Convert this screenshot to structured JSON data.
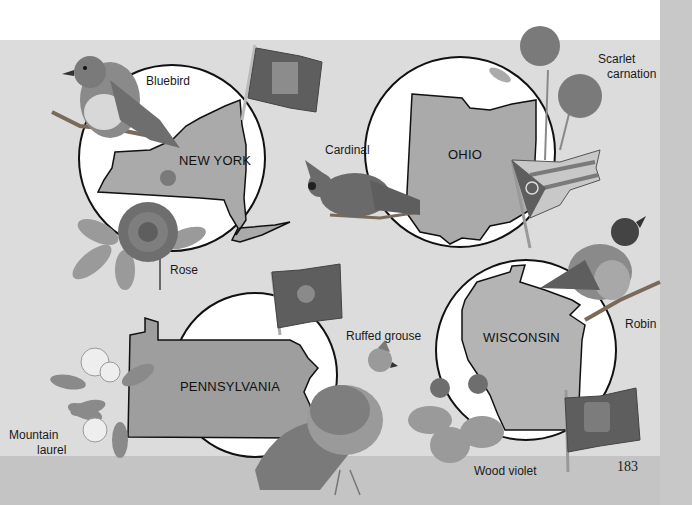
{
  "page": {
    "page_number": "183",
    "colors": {
      "page_background": "#dcdcdc",
      "circle_fill": "#ffffff",
      "state_fill": "#a9a9a9",
      "outline": "#111111"
    }
  },
  "states": [
    {
      "name": "NEW YORK",
      "bird": "Bluebird",
      "flower": "Rose",
      "flag_icon": "new-york-flag-icon"
    },
    {
      "name": "OHIO",
      "bird": "Cardinal",
      "flower_line1": "Scarlet",
      "flower_line2": "carnation",
      "flag_icon": "ohio-flag-icon"
    },
    {
      "name": "PENNSYLVANIA",
      "bird": "Ruffed grouse",
      "flower_line1": "Mountain",
      "flower_line2": "laurel",
      "flag_icon": "pennsylvania-flag-icon"
    },
    {
      "name": "WISCONSIN",
      "bird": "Robin",
      "flower": "Wood violet",
      "flag_icon": "wisconsin-flag-icon"
    }
  ]
}
